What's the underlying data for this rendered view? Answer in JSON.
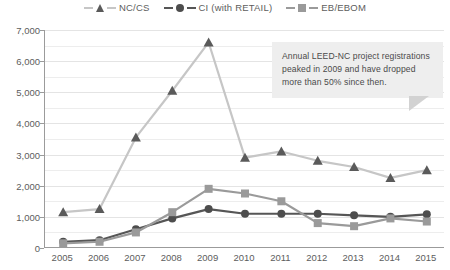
{
  "legend": {
    "position": "top-center",
    "items": [
      {
        "label": "NC/CS",
        "marker": "triangle-icon",
        "color": "#5a5a5a",
        "line_color": "#c6c6c6"
      },
      {
        "label": "CI (with RETAIL)",
        "marker": "circle-icon",
        "color": "#4d4d4d",
        "line_color": "#565656"
      },
      {
        "label": "EB/EBOM",
        "marker": "square-icon",
        "color": "#9a9a9a",
        "line_color": "#9a9a9a"
      }
    ]
  },
  "annotation": {
    "text": "Annual LEED-NC project registrations peaked in 2009 and have dropped more than 50% since then.",
    "background": "#eeeeee",
    "tail_color": "#d2d2d2"
  },
  "axis": {
    "y_ticks": [
      "0",
      "1,000",
      "2,000",
      "3,000",
      "4,000",
      "5,000",
      "6,000",
      "7,000"
    ],
    "x_ticks": [
      "2005",
      "2006",
      "2007",
      "2008",
      "2009",
      "2010",
      "2011",
      "2012",
      "2013",
      "2014",
      "2015"
    ]
  },
  "chart_data": {
    "type": "line",
    "title": "",
    "xlabel": "",
    "ylabel": "",
    "ylim": [
      0,
      7000
    ],
    "ytick_interval": 1000,
    "minor_gridline_interval": 500,
    "grid": true,
    "legend_position": "top-center",
    "categories": [
      "2005",
      "2006",
      "2007",
      "2008",
      "2009",
      "2010",
      "2011",
      "2012",
      "2013",
      "2014",
      "2015"
    ],
    "series": [
      {
        "name": "NC/CS",
        "color": "#5a5a5a",
        "line_color": "#c6c6c6",
        "marker": "triangle",
        "values": [
          1150,
          1250,
          3550,
          5050,
          6600,
          2900,
          3100,
          2800,
          2600,
          2250,
          2500
        ]
      },
      {
        "name": "CI (with RETAIL)",
        "color": "#4d4d4d",
        "line_color": "#565656",
        "marker": "circle",
        "values": [
          200,
          250,
          600,
          950,
          1250,
          1100,
          1100,
          1100,
          1050,
          1000,
          1080
        ]
      },
      {
        "name": "EB/EBOM",
        "color": "#9a9a9a",
        "line_color": "#9a9a9a",
        "marker": "square",
        "values": [
          150,
          200,
          500,
          1150,
          1900,
          1750,
          1500,
          800,
          700,
          950,
          850
        ]
      }
    ],
    "annotations": [
      {
        "text": "Annual LEED-NC project registrations peaked in 2009 and have dropped more than 50% since then.",
        "points_to": "2009"
      }
    ]
  }
}
